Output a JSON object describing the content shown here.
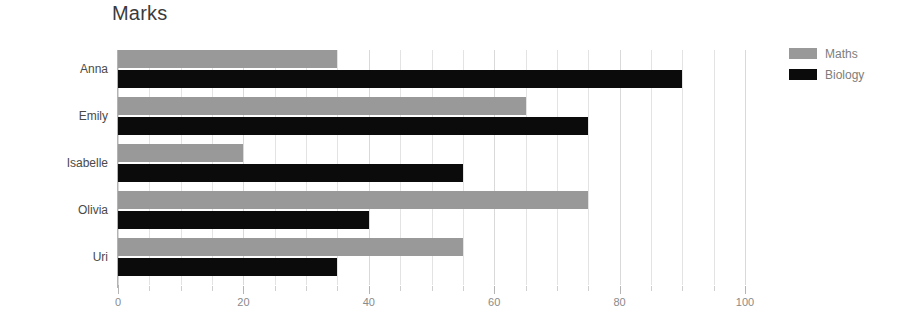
{
  "chart_data": {
    "type": "bar",
    "orientation": "horizontal",
    "title": "Marks",
    "xlabel": "",
    "ylabel": "",
    "categories": [
      "Anna",
      "Emily",
      "Isabelle",
      "Olivia",
      "Uri"
    ],
    "series": [
      {
        "name": "Maths",
        "color": "#999999",
        "values": [
          35,
          65,
          20,
          75,
          55
        ]
      },
      {
        "name": "Biology",
        "color": "#0b0b0b",
        "values": [
          90,
          75,
          55,
          40,
          35
        ]
      }
    ],
    "xlim": [
      0,
      100
    ],
    "xticks": [
      0,
      20,
      40,
      60,
      80,
      100
    ],
    "xtick_labels": [
      "0",
      "20",
      "40",
      "60",
      "80",
      "100"
    ],
    "minor_tick_step": 5,
    "grid": true,
    "grid_axis": "x",
    "legend_position": "top-right",
    "background": "#ffffff",
    "title_color": "#3b3b3b",
    "tick_label_color": "#8a8a8a",
    "category_label_color": "#4a4a4a",
    "gridline_color": "#e3e3e3"
  }
}
